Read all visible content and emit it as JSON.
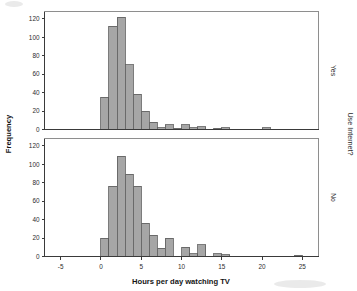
{
  "figure": {
    "xlabel": "Hours per day watching TV",
    "ylabel": "Frequency",
    "strip_title": "Use Internet?",
    "bar_fill_color": "#a6a6a6",
    "bar_edge_color": "#5b5b5b",
    "background_color": "#ffffff"
  },
  "axes": {
    "x_ticks": [
      "-5",
      "0",
      "5",
      "10",
      "15",
      "20",
      "25"
    ],
    "y_ticks": [
      "0",
      "20",
      "40",
      "60",
      "80",
      "100",
      "120"
    ]
  },
  "panels": [
    {
      "id": "yes",
      "label": "Yes"
    },
    {
      "id": "no",
      "label": "No"
    }
  ],
  "chart_data": {
    "type": "bar",
    "subtype": "histogram-panel-grid",
    "title": "",
    "xlabel": "Hours per day watching TV",
    "ylabel": "Frequency",
    "xlim": [
      -7,
      27
    ],
    "ylim": [
      0,
      128
    ],
    "x_ticks": [
      -5,
      0,
      5,
      10,
      15,
      20,
      25
    ],
    "y_ticks": [
      0,
      20,
      40,
      60,
      80,
      100,
      120
    ],
    "grid": false,
    "legend": "none",
    "bin_width": 1,
    "panel_variable": "Use Internet?",
    "panels": [
      {
        "name": "Yes",
        "bins": [
          {
            "x_left": 0,
            "x_right": 1,
            "frequency": 35
          },
          {
            "x_left": 1,
            "x_right": 2,
            "frequency": 112
          },
          {
            "x_left": 2,
            "x_right": 3,
            "frequency": 122
          },
          {
            "x_left": 3,
            "x_right": 4,
            "frequency": 70
          },
          {
            "x_left": 4,
            "x_right": 5,
            "frequency": 38
          },
          {
            "x_left": 5,
            "x_right": 6,
            "frequency": 20
          },
          {
            "x_left": 6,
            "x_right": 7,
            "frequency": 8
          },
          {
            "x_left": 7,
            "x_right": 8,
            "frequency": 2
          },
          {
            "x_left": 8,
            "x_right": 9,
            "frequency": 5
          },
          {
            "x_left": 9,
            "x_right": 10,
            "frequency": 1
          },
          {
            "x_left": 10,
            "x_right": 11,
            "frequency": 5
          },
          {
            "x_left": 11,
            "x_right": 12,
            "frequency": 2
          },
          {
            "x_left": 12,
            "x_right": 13,
            "frequency": 3
          },
          {
            "x_left": 14,
            "x_right": 15,
            "frequency": 1
          },
          {
            "x_left": 15,
            "x_right": 16,
            "frequency": 2
          },
          {
            "x_left": 20,
            "x_right": 21,
            "frequency": 2
          }
        ]
      },
      {
        "name": "No",
        "bins": [
          {
            "x_left": 0,
            "x_right": 1,
            "frequency": 20
          },
          {
            "x_left": 1,
            "x_right": 2,
            "frequency": 76
          },
          {
            "x_left": 2,
            "x_right": 3,
            "frequency": 109
          },
          {
            "x_left": 3,
            "x_right": 4,
            "frequency": 89
          },
          {
            "x_left": 4,
            "x_right": 5,
            "frequency": 76
          },
          {
            "x_left": 5,
            "x_right": 6,
            "frequency": 36
          },
          {
            "x_left": 6,
            "x_right": 7,
            "frequency": 23
          },
          {
            "x_left": 7,
            "x_right": 8,
            "frequency": 9
          },
          {
            "x_left": 8,
            "x_right": 9,
            "frequency": 20
          },
          {
            "x_left": 10,
            "x_right": 11,
            "frequency": 10
          },
          {
            "x_left": 11,
            "x_right": 12,
            "frequency": 3
          },
          {
            "x_left": 12,
            "x_right": 13,
            "frequency": 13
          },
          {
            "x_left": 14,
            "x_right": 15,
            "frequency": 3
          },
          {
            "x_left": 15,
            "x_right": 16,
            "frequency": 2
          },
          {
            "x_left": 24,
            "x_right": 25,
            "frequency": 1
          }
        ]
      }
    ]
  }
}
